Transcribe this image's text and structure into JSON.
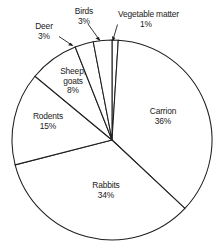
{
  "chart_data": {
    "type": "pie",
    "title": "",
    "subtitle": "",
    "xlabel": "",
    "ylabel": "",
    "legend": "none",
    "grid": false,
    "units": "percent",
    "total": 100,
    "categories": [
      "Vegetable matter",
      "Carrion",
      "Rabbits",
      "Rodents",
      "Sheep, goats",
      "Deer",
      "Birds"
    ],
    "values": [
      1,
      36,
      34,
      15,
      8,
      3,
      3
    ],
    "slices": [
      {
        "label": "Vegetable matter",
        "label_line1": "Vegetable matter",
        "value": 1,
        "pct_text": "1%",
        "start_angle": 0,
        "end_angle": 3.6,
        "leader": true
      },
      {
        "label": "Carrion",
        "label_line1": "Carrion",
        "value": 36,
        "pct_text": "36%",
        "start_angle": 3.6,
        "end_angle": 133.2,
        "leader": false
      },
      {
        "label": "Rabbits",
        "label_line1": "Rabbits",
        "value": 34,
        "pct_text": "34%",
        "start_angle": 133.2,
        "end_angle": 255.6,
        "leader": false
      },
      {
        "label": "Rodents",
        "label_line1": "Rodents",
        "value": 15,
        "pct_text": "15%",
        "start_angle": 255.6,
        "end_angle": 309.6,
        "leader": false
      },
      {
        "label": "Sheep, goats",
        "label_line1": "Sheep,",
        "label_line2": "goats",
        "value": 8,
        "pct_text": "8%",
        "start_angle": 309.6,
        "end_angle": 338.4,
        "leader": false
      },
      {
        "label": "Deer",
        "label_line1": "Deer",
        "value": 3,
        "pct_text": "3%",
        "start_angle": 338.4,
        "end_angle": 349.2,
        "leader": true
      },
      {
        "label": "Birds",
        "label_line1": "Birds",
        "value": 3,
        "pct_text": "3%",
        "start_angle": 349.2,
        "end_angle": 360,
        "leader": true
      }
    ],
    "colors": {
      "slice_fill": "#ffffff",
      "slice_stroke": "#1e1e1e",
      "background": "#ffffff",
      "text": "#1a1a1a"
    }
  }
}
